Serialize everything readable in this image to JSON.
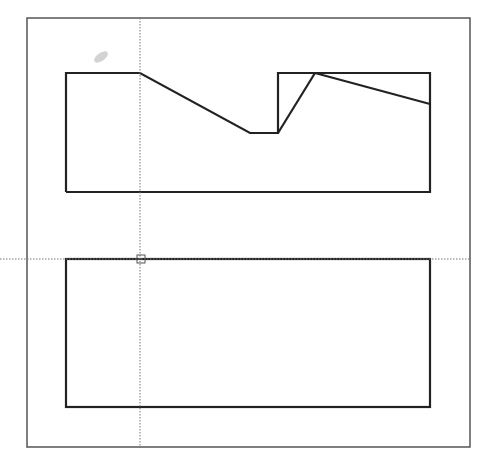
{
  "canvas": {
    "width": 493,
    "height": 472,
    "background": "#ffffff"
  },
  "frame": {
    "x": 27,
    "y": 18,
    "width": 443,
    "height": 429,
    "stroke": "#555555",
    "stroke_width": 1.5
  },
  "shapes": {
    "top_profile": {
      "points": "66,192 66,73 140,73 250,133 278,133 278,73 430,73 430,192 66,192",
      "stroke": "#222222",
      "stroke_width": 2.2
    },
    "top_diagonal_left": {
      "points": "278,133 315,73",
      "stroke": "#222222",
      "stroke_width": 2.2
    },
    "top_diagonal_right": {
      "points": "315,73 430,104",
      "stroke": "#222222",
      "stroke_width": 2.2
    },
    "bottom_rect": {
      "x": 66,
      "y": 259,
      "width": 364,
      "height": 148,
      "stroke": "#222222",
      "stroke_width": 2.2
    }
  },
  "crosshair": {
    "x": 140,
    "y": 259,
    "v_y1": 18,
    "v_y2": 447,
    "h_x1": 0,
    "h_x2": 470,
    "stroke": "#777777",
    "dash": "1.5,1.5",
    "pick_box": {
      "x": 137,
      "y": 255,
      "size": 8
    }
  },
  "smudge": {
    "cx": 101,
    "cy": 57,
    "rx": 8,
    "ry": 4,
    "rotate": -35,
    "fill": "#c8c8c8"
  }
}
